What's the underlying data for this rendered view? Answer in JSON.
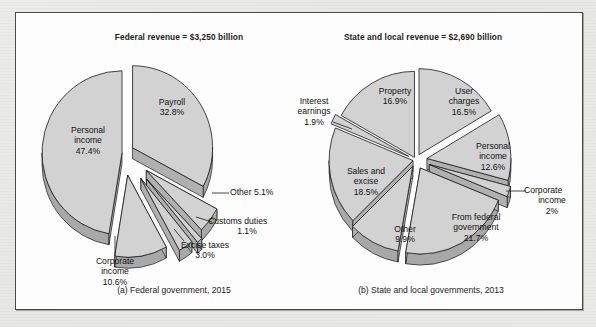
{
  "figure": {
    "background_color": "#fdfdfd",
    "frame_color": "#4a4a4a",
    "slice_face_color": "#d2d2d2",
    "slice_edge_color": "#a8a8a8",
    "slice_outline_color": "#1a1a1a"
  },
  "chart_data": [
    {
      "type": "pie",
      "id": "federal",
      "title": "Federal revenue = $3,250 billion",
      "caption": "(a) Federal government, 2015",
      "total_label": "$3,250 billion",
      "unit": "percent",
      "categories": [
        "Payroll",
        "Other",
        "Customs duties",
        "Excise taxes",
        "Corporate income",
        "Personal income"
      ],
      "values": [
        32.8,
        5.1,
        1.1,
        3.0,
        10.6,
        47.4
      ],
      "labels": [
        {
          "name": "Payroll",
          "value": "32.8%",
          "placement": "inside"
        },
        {
          "name": "Other",
          "value": "5.1%",
          "placement": "outside-leader"
        },
        {
          "name": "Customs duties",
          "value": "1.1%",
          "placement": "outside-leader"
        },
        {
          "name": "Excise taxes",
          "value": "3.0%",
          "placement": "outside-leader"
        },
        {
          "name": "Corporate income",
          "value": "10.6%",
          "placement": "outside-leader"
        },
        {
          "name": "Personal income",
          "value": "47.4%",
          "placement": "inside"
        }
      ]
    },
    {
      "type": "pie",
      "id": "state-local",
      "title": "State and local revenue = $2,690 billion",
      "caption": "(b) State and local governments, 2013",
      "total_label": "$2,690 billion",
      "unit": "percent",
      "categories": [
        "User charges",
        "Personal income",
        "Corporate income",
        "From federal government",
        "Other",
        "Sales and excise",
        "Interest earnings",
        "Property"
      ],
      "values": [
        16.5,
        12.6,
        2.0,
        21.7,
        9.9,
        18.5,
        1.9,
        16.9
      ],
      "labels": [
        {
          "name": "User charges",
          "value": "16.5%",
          "placement": "inside"
        },
        {
          "name": "Personal income",
          "value": "12.6%",
          "placement": "inside"
        },
        {
          "name": "Corporate income",
          "value": "2%",
          "placement": "outside-leader"
        },
        {
          "name": "From federal government",
          "value": "21.7%",
          "placement": "inside"
        },
        {
          "name": "Other",
          "value": "9.9%",
          "placement": "inside"
        },
        {
          "name": "Sales and excise",
          "value": "18.5%",
          "placement": "inside"
        },
        {
          "name": "Interest earnings",
          "value": "1.9%",
          "placement": "outside-leader"
        },
        {
          "name": "Property",
          "value": "16.9%",
          "placement": "inside"
        }
      ]
    }
  ],
  "labels": {
    "a_payroll_name": "Payroll",
    "a_payroll_val": "32.8%",
    "a_personal_name1": "Personal",
    "a_personal_name2": "income",
    "a_personal_val": "47.4%",
    "a_other": "Other 5.1%",
    "a_customs_name": "Customs duties",
    "a_customs_val": "1.1%",
    "a_excise_name": "Excise taxes",
    "a_excise_val": "3.0%",
    "a_corp_name1": "Corporate",
    "a_corp_name2": "income",
    "a_corp_val": "10.6%",
    "b_property_name": "Property",
    "b_property_val": "16.9%",
    "b_user_name1": "User",
    "b_user_name2": "charges",
    "b_user_val": "16.5%",
    "b_personal_name1": "Personal",
    "b_personal_name2": "income",
    "b_personal_val": "12.6%",
    "b_corp_name1": "Corporate",
    "b_corp_name2": "income",
    "b_corp_val": "2%",
    "b_fromfed_name1": "From federal",
    "b_fromfed_name2": "government",
    "b_fromfed_val": "21.7%",
    "b_other_name": "Other",
    "b_other_val": "9.9%",
    "b_sales_name1": "Sales and",
    "b_sales_name2": "excise",
    "b_sales_val": "18.5%",
    "b_interest_name1": "Interest",
    "b_interest_name2": "earnings",
    "b_interest_val": "1.9%"
  }
}
